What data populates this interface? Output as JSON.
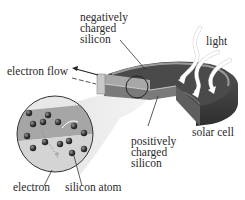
{
  "diagram": {
    "title": "Solar cell",
    "labels": {
      "negative_silicon": [
        "negatively",
        "charged",
        "silicon"
      ],
      "light": "light",
      "electron_flow": "electron flow",
      "solar_cell": "solar cell",
      "positive_silicon": [
        "positively",
        "charged",
        "silicon"
      ],
      "electron": "electron",
      "silicon_atom": "silicon atom"
    },
    "colors": {
      "cell_top": "#4a4a4a",
      "cell_side": "#3a3a3a",
      "cell_rim": "#8a8a8a",
      "layer_light": "#b8b8b8",
      "magnifier_band": "#9a9a9a",
      "atom": "#3a3a3a",
      "beam": "#e4e4e4"
    }
  }
}
